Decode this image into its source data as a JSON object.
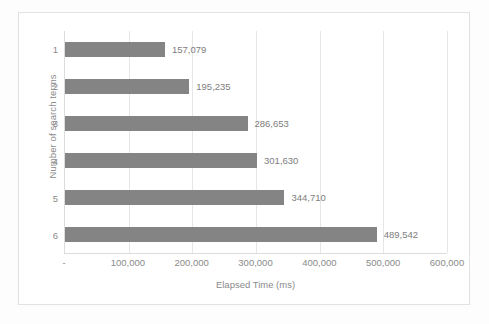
{
  "chart_data": {
    "type": "bar",
    "orientation": "horizontal",
    "title": "",
    "xlabel": "Elapsed Time (ms)",
    "ylabel": "Number of search terms",
    "categories": [
      "1",
      "2",
      "3",
      "4",
      "5",
      "6"
    ],
    "values": [
      157079,
      195235,
      286653,
      301630,
      344710,
      489542
    ],
    "data_labels": [
      "157,079",
      "195,235",
      "286,653",
      "301,630",
      "344,710",
      "489,542"
    ],
    "xlim": [
      0,
      600000
    ],
    "xticks": [
      0,
      100000,
      200000,
      300000,
      400000,
      500000,
      600000
    ],
    "xtick_labels": [
      "-",
      "100,000",
      "200,000",
      "300,000",
      "400,000",
      "500,000",
      "600,000"
    ],
    "grid": "vertical",
    "legend": "none",
    "bar_color": "#848484",
    "gridline_color": "#e6e6e6",
    "axis_line_color": "#dcdcdc",
    "text_color": "#8a8a8a",
    "frame_color": "#e2e2e2",
    "plot_background": "#ffffff"
  }
}
